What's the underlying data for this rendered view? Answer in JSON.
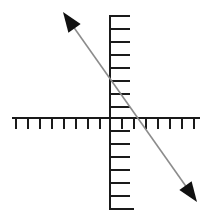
{
  "figure": {
    "type": "coordinate-axes-diagram",
    "width": 212,
    "height": 223,
    "background_color": "#ffffff"
  },
  "chart_data": {
    "type": "line",
    "title": "",
    "subtitle": "",
    "xlabel": "",
    "ylabel": "",
    "grid": false,
    "legend": null,
    "axes": {
      "origin_px": [
        110,
        118
      ],
      "tick_spacing_px": 12,
      "x_axis": {
        "color": "#1a1a1a",
        "line_width_px": 2,
        "start_px": [
          12,
          118
        ],
        "end_px": [
          200,
          118
        ],
        "tick_direction": "down",
        "tick_length_px": 11,
        "tick_count_negative": 8,
        "tick_count_positive": 7,
        "tick_labels": [],
        "range": [
          -8,
          7
        ]
      },
      "y_axis": {
        "color": "#1a1a1a",
        "line_width_px": 2,
        "start_px": [
          110,
          15
        ],
        "end_px": [
          110,
          210
        ],
        "tick_direction": "right",
        "tick_length_px": 13,
        "tick_count_positive": 8,
        "tick_count_negative": 7,
        "tick_labels": [],
        "range": [
          -7,
          8
        ]
      }
    },
    "series": [
      {
        "name": "descending-line",
        "color": "#8c8c8c",
        "line_width_px": 1.6,
        "arrow_start": true,
        "arrow_end": true,
        "arrow_color": "#111111",
        "start_px": [
          63,
          12
        ],
        "end_px": [
          197,
          202
        ],
        "x": [
          -3.9,
          7.25
        ],
        "y": [
          8.8,
          -7.0
        ],
        "slope": -1.42,
        "y_intercept": 4.25,
        "x_intercept": 3.0
      }
    ]
  }
}
